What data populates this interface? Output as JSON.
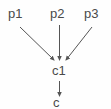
{
  "diagram": {
    "type": "directed-acyclic-graph",
    "title": "",
    "background_color": "#fefefe",
    "edge_color": "#555555",
    "label_color": "#4a4a4a",
    "nodes": [
      {
        "id": "p1",
        "label": "p1",
        "role": "parent",
        "x": 17,
        "y": 15
      },
      {
        "id": "p2",
        "label": "p2",
        "role": "parent",
        "x": 59,
        "y": 15
      },
      {
        "id": "p3",
        "label": "p3",
        "role": "parent",
        "x": 93,
        "y": 15
      },
      {
        "id": "c1",
        "label": "c1",
        "role": "child",
        "x": 60,
        "y": 71
      },
      {
        "id": "c2",
        "label": "c",
        "role": "child",
        "x": 60,
        "y": 103,
        "clipped": true
      }
    ],
    "edges": [
      {
        "from": "p1",
        "to": "c1",
        "arrowhead": "filled-triangle"
      },
      {
        "from": "p2",
        "to": "c1",
        "arrowhead": "filled-triangle"
      },
      {
        "from": "p3",
        "to": "c1",
        "arrowhead": "filled-triangle"
      },
      {
        "from": "c1",
        "to": "c2",
        "arrowhead": "filled-triangle"
      }
    ]
  }
}
